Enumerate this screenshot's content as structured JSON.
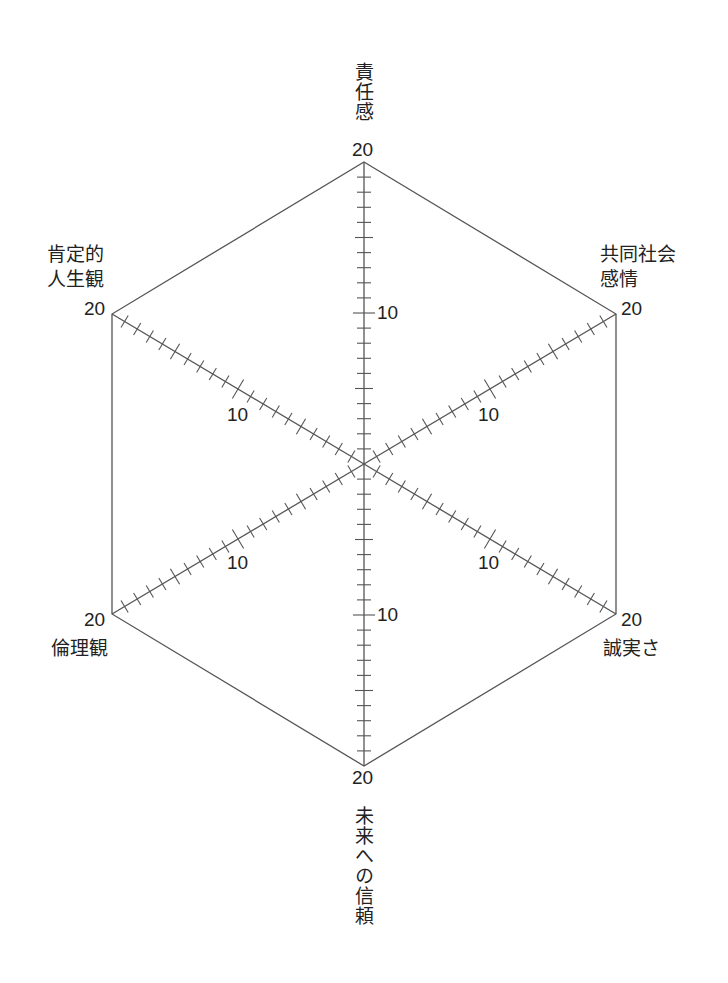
{
  "chart_data": {
    "type": "radar",
    "title": "",
    "axes": [
      {
        "name": "責任感",
        "angle_deg": 90
      },
      {
        "name": "共同社会感情",
        "angle_deg": 30
      },
      {
        "name": "誠実さ",
        "angle_deg": -30
      },
      {
        "name": "未来への信頼",
        "angle_deg": -90
      },
      {
        "name": "倫理観",
        "angle_deg": -150
      },
      {
        "name": "肯定的人生観",
        "angle_deg": 150
      }
    ],
    "range": [
      0,
      20
    ],
    "ticks_every": 1,
    "tick_labels": [
      10,
      20
    ],
    "series": [],
    "grid": "outer hexagon only",
    "legend": "none"
  },
  "labels": {
    "top": "責任感",
    "upper_right_line1": "共同社会",
    "upper_right_line2": "感情",
    "lower_right": "誠実さ",
    "bottom": "未来への信頼",
    "lower_left": "倫理観",
    "upper_left_line1": "肯定的",
    "upper_left_line2": "人生観"
  },
  "scale": {
    "max": "20",
    "mid": "10"
  },
  "colors": {
    "line": "#555555",
    "text": "#222222"
  }
}
